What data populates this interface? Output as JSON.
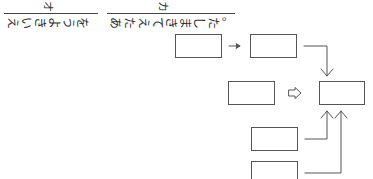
{
  "header": {
    "segments": [
      {
        "label": "オ",
        "text": "えいきようを",
        "chars": [
          "え",
          "い",
          "き",
          "よ",
          "う",
          "を"
        ]
      },
      {
        "label": "カ",
        "text": "あたえてきました。",
        "chars": [
          "あ",
          "た",
          "え",
          "て",
          "き",
          "ま",
          "し",
          "た",
          "。"
        ]
      }
    ]
  },
  "diagram": {
    "boxes": [
      {
        "id": "box-1",
        "text": ""
      },
      {
        "id": "box-2",
        "text": ""
      },
      {
        "id": "box-3",
        "text": ""
      },
      {
        "id": "box-4",
        "text": ""
      },
      {
        "id": "box-5",
        "text": ""
      },
      {
        "id": "box-6",
        "text": ""
      }
    ],
    "connectors": [
      {
        "from": "box-1",
        "to": "box-2",
        "style": "thin-arrow"
      },
      {
        "from": "box-2",
        "to": "box-4",
        "style": "elbow-arrow"
      },
      {
        "from": "box-3",
        "to": "box-4",
        "style": "hollow-arrow"
      },
      {
        "from": "box-5",
        "to": "box-4",
        "style": "elbow-arrow"
      },
      {
        "from": "box-6",
        "to": "box-4",
        "style": "elbow-arrow"
      }
    ],
    "colors": {
      "stroke": "#555555",
      "background": "#ffffff"
    }
  }
}
